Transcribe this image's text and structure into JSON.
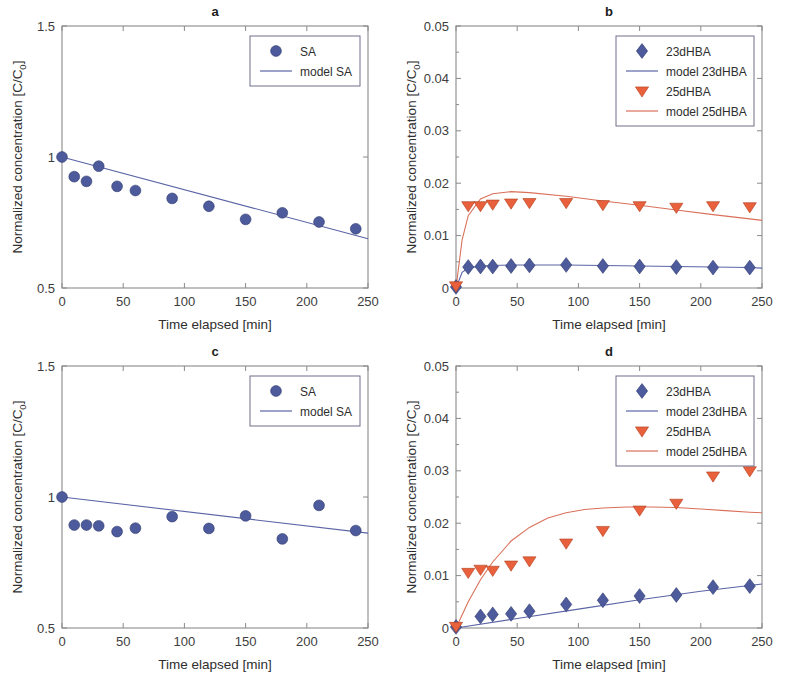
{
  "figure": {
    "axis_x_label": "Time elapsed [min]",
    "axis_y_label_main": "Normalized concentration [C/C",
    "axis_y_label_sub": "0",
    "axis_y_label_tail": "]",
    "colors": {
      "blue_marker": "#4d5a9b",
      "blue_line": "#5a64a6",
      "orange_marker": "#e8603c",
      "orange_line": "#d9705a",
      "axis": "#8a8a8a",
      "text": "#2e2e2e"
    },
    "x_ticks": [
      "0",
      "50",
      "100",
      "150",
      "200",
      "250"
    ],
    "x_tick_values": [
      0,
      50,
      100,
      150,
      200,
      250
    ],
    "xlim": [
      0,
      250
    ],
    "y_ticks_sa": [
      "0.5",
      "1",
      "1.5"
    ],
    "y_tick_values_sa": [
      0.5,
      1,
      1.5
    ],
    "ylim_sa": [
      0.5,
      1.5
    ],
    "y_ticks_hba": [
      "0",
      "0.01",
      "0.02",
      "0.03",
      "0.04",
      "0.05"
    ],
    "y_tick_values_hba": [
      0,
      0.01,
      0.02,
      0.03,
      0.04,
      0.05
    ],
    "ylim_hba": [
      0,
      0.05
    ]
  },
  "chart_data": [
    {
      "panel": "a",
      "type": "scatter",
      "title": "a",
      "xlabel": "Time elapsed [min]",
      "ylabel": "Normalized concentration [C/C0]",
      "xlim": [
        0,
        250
      ],
      "ylim": [
        0.5,
        1.5
      ],
      "grid": false,
      "legend_position": "top-right",
      "series": [
        {
          "name": "SA",
          "marker": "circle",
          "color": "#4d5a9b",
          "x": [
            0,
            10,
            20,
            30,
            45,
            60,
            90,
            120,
            150,
            180,
            210,
            240
          ],
          "y": [
            1.0,
            0.925,
            0.907,
            0.965,
            0.888,
            0.872,
            0.842,
            0.812,
            0.762,
            0.787,
            0.752,
            0.726
          ]
        },
        {
          "name": "model SA",
          "marker": "line",
          "color": "#5a64a6",
          "x": [
            0,
            250
          ],
          "y": [
            1.0,
            0.688
          ]
        }
      ]
    },
    {
      "panel": "b",
      "type": "scatter",
      "title": "b",
      "xlabel": "Time elapsed [min]",
      "ylabel": "Normalized concentration [C/C0]",
      "xlim": [
        0,
        250
      ],
      "ylim": [
        0,
        0.05
      ],
      "grid": false,
      "legend_position": "top-right",
      "series": [
        {
          "name": "23dHBA",
          "marker": "diamond",
          "color": "#4d5a9b",
          "x": [
            0,
            10,
            20,
            30,
            45,
            60,
            90,
            120,
            150,
            180,
            210,
            240
          ],
          "y": [
            0.0002,
            0.004,
            0.0041,
            0.0041,
            0.0042,
            0.0043,
            0.0044,
            0.0042,
            0.0041,
            0.004,
            0.0039,
            0.0039
          ]
        },
        {
          "name": "model 23dHBA",
          "marker": "line",
          "color": "#5a64a6",
          "x": [
            0,
            5,
            10,
            20,
            30,
            45,
            60,
            90,
            120,
            150,
            180,
            210,
            240,
            250
          ],
          "y": [
            0.0,
            0.003,
            0.0038,
            0.0042,
            0.0043,
            0.0044,
            0.0044,
            0.0044,
            0.0043,
            0.0042,
            0.0041,
            0.004,
            0.0039,
            0.0038
          ]
        },
        {
          "name": "25dHBA",
          "marker": "triangle-down",
          "color": "#e8603c",
          "x": [
            0,
            10,
            20,
            30,
            45,
            60,
            90,
            120,
            150,
            180,
            210,
            240
          ],
          "y": [
            0.0004,
            0.0157,
            0.0157,
            0.016,
            0.0162,
            0.0163,
            0.0163,
            0.0159,
            0.0157,
            0.0154,
            0.0157,
            0.0155
          ]
        },
        {
          "name": "model 25dHBA",
          "marker": "line",
          "color": "#d9705a",
          "x": [
            0,
            5,
            10,
            20,
            30,
            45,
            60,
            90,
            120,
            150,
            180,
            210,
            240,
            250
          ],
          "y": [
            0.0,
            0.0092,
            0.0138,
            0.017,
            0.018,
            0.0184,
            0.0182,
            0.0175,
            0.0166,
            0.0158,
            0.0149,
            0.014,
            0.0132,
            0.0129
          ]
        }
      ]
    },
    {
      "panel": "c",
      "type": "scatter",
      "title": "c",
      "xlabel": "Time elapsed [min]",
      "ylabel": "Normalized concentration [C/C0]",
      "xlim": [
        0,
        250
      ],
      "ylim": [
        0.5,
        1.5
      ],
      "grid": false,
      "legend_position": "top-right",
      "series": [
        {
          "name": "SA",
          "marker": "circle",
          "color": "#4d5a9b",
          "x": [
            0,
            10,
            20,
            30,
            45,
            60,
            90,
            120,
            150,
            180,
            210,
            240
          ],
          "y": [
            1.0,
            0.893,
            0.893,
            0.89,
            0.868,
            0.881,
            0.925,
            0.88,
            0.928,
            0.84,
            0.968,
            0.872
          ]
        },
        {
          "name": "model SA",
          "marker": "line",
          "color": "#5a64a6",
          "x": [
            0,
            250
          ],
          "y": [
            1.0,
            0.862
          ]
        }
      ]
    },
    {
      "panel": "d",
      "type": "scatter",
      "title": "d",
      "xlabel": "Time elapsed [min]",
      "ylabel": "Normalized concentration [C/C0]",
      "xlim": [
        0,
        250
      ],
      "ylim": [
        0,
        0.05
      ],
      "grid": false,
      "legend_position": "top-right",
      "series": [
        {
          "name": "23dHBA",
          "marker": "diamond",
          "color": "#4d5a9b",
          "x": [
            0,
            20,
            30,
            45,
            60,
            90,
            120,
            150,
            180,
            210,
            240
          ],
          "y": [
            0.0002,
            0.0022,
            0.0026,
            0.0027,
            0.0032,
            0.0045,
            0.0053,
            0.0061,
            0.0063,
            0.0078,
            0.008
          ]
        },
        {
          "name": "model 23dHBA",
          "marker": "line",
          "color": "#5a64a6",
          "x": [
            0,
            50,
            100,
            150,
            200,
            250
          ],
          "y": [
            0.0,
            0.0018,
            0.0036,
            0.0054,
            0.007,
            0.0084
          ]
        },
        {
          "name": "25dHBA",
          "marker": "triangle-down",
          "color": "#e8603c",
          "x": [
            0,
            10,
            20,
            30,
            45,
            60,
            90,
            120,
            150,
            180,
            210,
            240
          ],
          "y": [
            0.0003,
            0.0106,
            0.0112,
            0.011,
            0.012,
            0.0128,
            0.0162,
            0.0186,
            0.0225,
            0.0238,
            0.029,
            0.03
          ]
        },
        {
          "name": "model 25dHBA",
          "marker": "line",
          "color": "#d9705a",
          "x": [
            0,
            10,
            20,
            30,
            45,
            60,
            75,
            90,
            105,
            120,
            140,
            160,
            180,
            200,
            220,
            240,
            250
          ],
          "y": [
            0.0,
            0.005,
            0.0092,
            0.0126,
            0.0166,
            0.0192,
            0.021,
            0.022,
            0.0226,
            0.0229,
            0.0231,
            0.0231,
            0.023,
            0.0227,
            0.0224,
            0.0221,
            0.022
          ]
        }
      ]
    }
  ],
  "panels": {
    "a": {
      "title": "a",
      "legend": [
        {
          "label": "SA",
          "marker": "circle",
          "color": "#4d5a9b"
        },
        {
          "label": "model SA",
          "marker": "line",
          "color": "#5a64a6"
        }
      ]
    },
    "b": {
      "title": "b",
      "legend": [
        {
          "label": "23dHBA",
          "marker": "diamond",
          "color": "#4d5a9b"
        },
        {
          "label": "model 23dHBA",
          "marker": "line",
          "color": "#5a64a6"
        },
        {
          "label": "25dHBA",
          "marker": "triangle-down",
          "color": "#e8603c"
        },
        {
          "label": "model 25dHBA",
          "marker": "line",
          "color": "#d9705a"
        }
      ]
    },
    "c": {
      "title": "c",
      "legend": [
        {
          "label": "SA",
          "marker": "circle",
          "color": "#4d5a9b"
        },
        {
          "label": "model SA",
          "marker": "line",
          "color": "#5a64a6"
        }
      ]
    },
    "d": {
      "title": "d",
      "legend": [
        {
          "label": "23dHBA",
          "marker": "diamond",
          "color": "#4d5a9b"
        },
        {
          "label": "model 23dHBA",
          "marker": "line",
          "color": "#5a64a6"
        },
        {
          "label": "25dHBA",
          "marker": "triangle-down",
          "color": "#e8603c"
        },
        {
          "label": "model 25dHBA",
          "marker": "line",
          "color": "#d9705a"
        }
      ]
    }
  }
}
